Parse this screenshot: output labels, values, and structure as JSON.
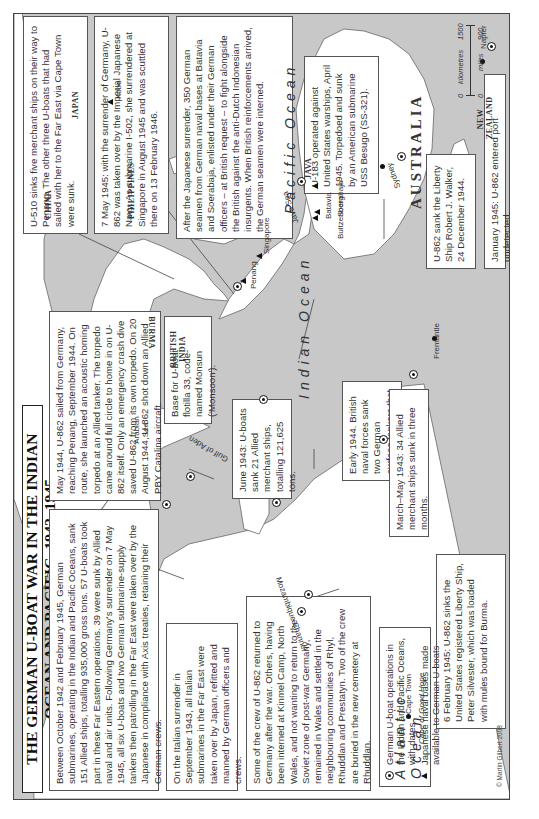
{
  "title": "THE GERMAN U-BOAT WAR IN THE INDIAN OCEAN AND PACIFIC, 1942–1945",
  "boxes": {
    "overview": "Between October 1942 and February 1945, German submarines, operating in the Indian and Pacific Oceans, sank 151 Allied ships, totalling 935,000 gross tons. 57 U-boats took part in these Far Eastern operations. 39 were sunk by Allied naval and air units. Following Germany's surrender on 7 May 1945, all six U-boats and two German submarine-supply tankers then patrolling in the Far East were taken over by the Japanese in compliance with Axis treaties, retaining their German crews.",
    "italian_surrender": "On the Italian surrender in September 1943, all Italian submarines in the Far East were taken over by Japan, refitted and manned by German officers and crews.",
    "crew_u862": "Some of the crew of U-862 returned to Germany after the war. Others, having been interned at Kinmel Camp, North Wales, and not wanting to return to the Soviet zone of post-war Germany, remained in Wales and settled in the neighbouring communities of Rhyl, Rhuddlan and Prestatyn. Two of the crew are buried in the new cemetery at Rhuddlan.",
    "may_1944": "May 1944, U-862 sailed from Germany, reaching Penang, September 1944. On route, she launched an acoustic homing torpedo at an Allied tanker. The torpedo came around full circle to home in on U-862 itself. Only an emergency crash dive saved U-862 from its own torpedo. On 20 August 1944, U-862 shot down an Allied PBY Catalina aircraft.",
    "base_flotilla": "Base for U-boat flotilla 33, code-named Monsun ('Monsoon').",
    "june_1943": "June 1943: U-boats sank 21 Allied merchant ships, totalling 121,625 tons.",
    "u510": "U-510 sinks five merchant ships on their way to Penang. The other three U-boats that had sailed with her to the Far East via Cape Town were sunk.",
    "may_1945": "7 May 1945: with the surrender of Germany, U-862 was taken over by the Imperial Japanese Navy. As submarine I-502, she surrendered at Singapore in August 1945 and was scuttled there on 13 February 1946.",
    "japanese_surrender": "After the Japanese surrender, 350 German seamen from German naval bases at Batavia and Soerabaja, enlisted under their German officers – at British request – to fight alongside the British against the anti-Dutch Indonesian insurgents. When British reinforcements arrived, the German seamen were interned.",
    "early_1944": "Early 1944. British naval forces sank two German surface tankers that were supplying U-boats with fuel.",
    "march_may_1943": "March–May 1943: 34 Allied merchant ships sunk in three months.",
    "feb_1945": "6 February 1945: U-862 sinks the United States registered Liberty Ship, Peter Silvester, which was loaded with mules bound for Burma.",
    "u183": "U-183 operated against United States warships, April 1945. Torpedoed and sunk by an American submarine USS Besugo (SS-321).",
    "robert_walker": "U-862 sank the Liberty Ship Robert J. Walker, 24 December 1944.",
    "jan_1945": "January 1945: U-862 entered port undetected."
  },
  "places": {
    "countries": [
      "CHINA",
      "JAPAN",
      "PHILIPPINES",
      "BURMA",
      "BRITISH INDIA",
      "AUSTRALIA",
      "NEW ZEALAND",
      "JAVA"
    ],
    "cities": [
      "Kobe",
      "Penang",
      "Singapore",
      "Batavia",
      "Buitzenborg",
      "Soerabaja",
      "Sydney",
      "Fremantle",
      "Napier",
      "Cape Town"
    ],
    "seas": [
      "Arabian Sea",
      "Gulf of Aden",
      "Mozambique Channel",
      "Java Sea",
      "Cape of Good Hope"
    ],
    "oceans": [
      "Pacific Ocean",
      "Indian Ocean",
      "Atlantic Ocean"
    ]
  },
  "legend": {
    "items": [
      {
        "symbol": "target-marker",
        "label": "German U-boat operations in the Indian and Pacific Oceans, with dates"
      },
      {
        "symbol": "triangle",
        "label": "Japanese naval bases made available to German U-boats"
      }
    ]
  },
  "scale": {
    "zero": "0",
    "km_label": "kilometres",
    "km_value": "1500",
    "miles_label": "miles",
    "miles_value": "900"
  },
  "copyright": "© Martin Gilbert 2008",
  "colors": {
    "sea": "#c8c8c8",
    "land": "#ffffff",
    "border": "#444444",
    "text": "#333333"
  }
}
